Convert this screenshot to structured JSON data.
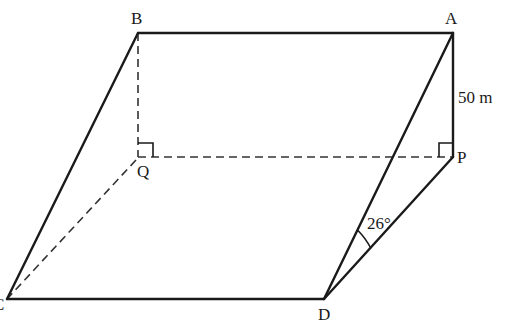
{
  "diagram": {
    "type": "3d-geometry-inclined-plane",
    "points": {
      "A": {
        "label": "A",
        "x": 453,
        "y": 33
      },
      "B": {
        "label": "B",
        "x": 138,
        "y": 33
      },
      "P": {
        "label": "P",
        "x": 453,
        "y": 157
      },
      "Q": {
        "label": "Q",
        "x": 138,
        "y": 157
      },
      "C": {
        "label": "C",
        "x": 7,
        "y": 299
      },
      "D": {
        "label": "D",
        "x": 324,
        "y": 299
      }
    },
    "solid_edges": [
      "AB",
      "BC",
      "CD",
      "DA",
      "AP",
      "PD"
    ],
    "dashed_edges": [
      "BQ",
      "QP",
      "QC"
    ],
    "right_angles": [
      "Q",
      "P"
    ],
    "annotations": {
      "height_label": "50 m",
      "angle_label": "26°"
    }
  }
}
